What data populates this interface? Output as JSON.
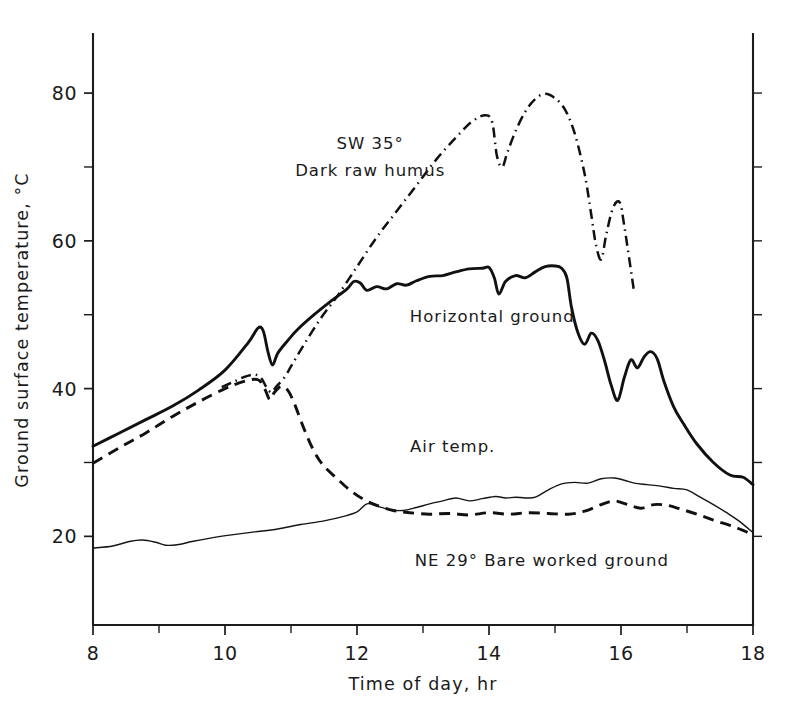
{
  "chart_data": {
    "type": "line",
    "title": "",
    "xlabel": "Time of day, hr",
    "ylabel": "Ground surface temperature, °C",
    "xlim": [
      8,
      18
    ],
    "ylim": [
      8,
      88
    ],
    "grid": false,
    "legend_position": "inline-annotations",
    "xticks": [
      8,
      10,
      12,
      14,
      16,
      18
    ],
    "xtick_labels": [
      "8",
      "10",
      "12",
      "14",
      "16",
      "18"
    ],
    "xticks_minor": [
      9,
      11,
      13,
      15,
      17
    ],
    "yticks": [
      20,
      40,
      60,
      80
    ],
    "ytick_labels": [
      "20",
      "40",
      "60",
      "80"
    ],
    "yticks_minor": [
      30,
      50,
      70
    ],
    "annotations": [
      {
        "text": "SW 35°",
        "x": 12.2,
        "y": 72.5
      },
      {
        "text": "Dark raw humus",
        "x": 12.2,
        "y": 68.8
      },
      {
        "text": "Horizontal ground",
        "x": 14.05,
        "y": 49.0
      },
      {
        "text": "Air temp.",
        "x": 13.45,
        "y": 31.4
      },
      {
        "text": "NE 29° Bare worked ground",
        "x": 14.8,
        "y": 16.0
      }
    ],
    "series": [
      {
        "name": "SW 35° Dark raw humus",
        "style": "dash-dot",
        "x": [
          9.95,
          10.15,
          10.3,
          10.45,
          10.55,
          10.62,
          10.7,
          10.78,
          10.9,
          11.0,
          11.2,
          11.45,
          11.7,
          12.0,
          12.3,
          12.6,
          12.9,
          13.2,
          13.5,
          13.75,
          13.95,
          14.05,
          14.12,
          14.2,
          14.28,
          14.4,
          14.55,
          14.7,
          14.85,
          15.0,
          15.15,
          15.3,
          15.45,
          15.55,
          15.62,
          15.7,
          15.78,
          15.88,
          15.98,
          16.05,
          16.2
        ],
        "y": [
          40.2,
          41.0,
          41.6,
          41.9,
          41.4,
          40.3,
          39.5,
          40.3,
          41.5,
          43.0,
          46.0,
          49.5,
          52.5,
          56.5,
          60.5,
          64.0,
          67.5,
          71.0,
          74.0,
          76.2,
          77.0,
          76.0,
          71.5,
          70.0,
          72.0,
          74.8,
          77.5,
          79.2,
          79.9,
          79.3,
          77.8,
          74.5,
          69.0,
          63.5,
          59.5,
          57.5,
          61.0,
          64.5,
          65.2,
          62.0,
          53.0
        ]
      },
      {
        "name": "Horizontal ground",
        "style": "solid",
        "x": [
          8.0,
          8.4,
          8.8,
          9.2,
          9.6,
          10.0,
          10.35,
          10.5,
          10.58,
          10.65,
          10.72,
          10.8,
          10.95,
          11.1,
          11.35,
          11.6,
          11.85,
          11.95,
          12.05,
          12.15,
          12.3,
          12.45,
          12.6,
          12.75,
          12.9,
          13.1,
          13.3,
          13.5,
          13.7,
          13.9,
          14.0,
          14.08,
          14.15,
          14.25,
          14.4,
          14.55,
          14.7,
          14.85,
          15.0,
          15.1,
          15.18,
          15.25,
          15.35,
          15.45,
          15.55,
          15.65,
          15.75,
          15.85,
          15.95,
          16.05,
          16.15,
          16.25,
          16.35,
          16.45,
          16.55,
          16.65,
          16.8,
          16.95,
          17.15,
          17.4,
          17.65,
          17.85,
          18.0
        ],
        "y": [
          32.2,
          34.0,
          35.8,
          37.6,
          39.8,
          42.5,
          46.2,
          48.2,
          47.8,
          45.0,
          43.2,
          44.8,
          46.5,
          48.0,
          50.0,
          51.8,
          53.5,
          54.5,
          54.3,
          53.3,
          53.8,
          53.5,
          54.2,
          54.0,
          54.6,
          55.2,
          55.3,
          55.8,
          56.2,
          56.3,
          56.4,
          55.0,
          52.8,
          54.5,
          55.3,
          55.0,
          55.8,
          56.5,
          56.6,
          56.3,
          55.0,
          51.0,
          47.5,
          46.0,
          47.5,
          46.5,
          43.8,
          40.5,
          38.4,
          41.5,
          43.9,
          42.8,
          44.3,
          45.0,
          44.0,
          41.0,
          37.5,
          35.2,
          32.5,
          30.0,
          28.3,
          28.0,
          27.0
        ]
      },
      {
        "name": "NE 29° Bare worked ground",
        "style": "dashed",
        "x": [
          8.0,
          8.4,
          8.8,
          9.2,
          9.6,
          10.0,
          10.3,
          10.5,
          10.6,
          10.68,
          10.75,
          10.85,
          10.95,
          11.05,
          11.2,
          11.35,
          11.5,
          11.7,
          11.9,
          12.1,
          12.3,
          12.55,
          12.8,
          13.1,
          13.4,
          13.7,
          14.0,
          14.3,
          14.6,
          14.9,
          15.2,
          15.45,
          15.7,
          15.9,
          16.1,
          16.3,
          16.5,
          16.7,
          16.9,
          17.15,
          17.4,
          17.65,
          17.85,
          18.0
        ],
        "y": [
          29.9,
          32.0,
          34.0,
          36.2,
          38.2,
          40.0,
          41.0,
          41.2,
          40.0,
          38.5,
          39.5,
          40.3,
          39.8,
          38.0,
          34.5,
          31.5,
          29.5,
          27.8,
          26.2,
          25.0,
          24.2,
          23.5,
          23.2,
          23.0,
          23.1,
          22.9,
          23.2,
          23.0,
          23.2,
          23.1,
          23.0,
          23.4,
          24.3,
          24.8,
          24.3,
          23.8,
          24.3,
          24.2,
          23.7,
          23.0,
          22.2,
          21.5,
          20.8,
          20.2
        ]
      },
      {
        "name": "Air temp.",
        "style": "thin-solid",
        "x": [
          8.0,
          8.3,
          8.55,
          8.75,
          8.95,
          9.1,
          9.3,
          9.5,
          9.8,
          10.1,
          10.45,
          10.8,
          11.15,
          11.5,
          11.8,
          12.0,
          12.15,
          12.3,
          12.5,
          12.7,
          12.9,
          13.1,
          13.3,
          13.5,
          13.7,
          13.9,
          14.1,
          14.25,
          14.4,
          14.55,
          14.7,
          14.9,
          15.1,
          15.3,
          15.5,
          15.7,
          15.9,
          16.05,
          16.2,
          16.4,
          16.6,
          16.8,
          17.0,
          17.2,
          17.4,
          17.6,
          17.8,
          18.0
        ],
        "y": [
          18.4,
          18.7,
          19.3,
          19.5,
          19.2,
          18.8,
          18.9,
          19.3,
          19.8,
          20.2,
          20.6,
          21.0,
          21.6,
          22.1,
          22.7,
          23.3,
          24.4,
          24.1,
          23.6,
          23.5,
          23.9,
          24.4,
          24.8,
          25.2,
          24.8,
          25.1,
          25.4,
          25.2,
          25.3,
          25.2,
          25.3,
          26.3,
          27.1,
          27.3,
          27.2,
          27.8,
          27.9,
          27.6,
          27.2,
          27.0,
          26.8,
          26.5,
          26.3,
          25.3,
          24.3,
          23.2,
          22.0,
          20.5
        ]
      }
    ]
  },
  "colors": {
    "ink": "#111111",
    "background": "#ffffff"
  }
}
